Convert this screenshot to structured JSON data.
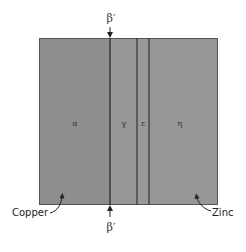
{
  "diagram": {
    "colors": {
      "alpha_fill": "#8e8e8e",
      "gamma_fill": "#969696",
      "epsilon_fill": "#989898",
      "eta_fill": "#969696",
      "line": "#333333",
      "border": "#555555"
    },
    "block": {
      "left": 39,
      "top": 38,
      "right": 218,
      "bottom": 205
    },
    "boundaries_x": [
      110,
      137,
      149
    ],
    "phases": [
      {
        "symbol": "α",
        "x": 75
      },
      {
        "symbol": "γ",
        "x": 124
      },
      {
        "symbol": "ε",
        "x": 143
      },
      {
        "symbol": "η",
        "x": 180
      }
    ],
    "top_marker": {
      "label": "β′",
      "x": 110
    },
    "bottom_marker": {
      "label": "β′",
      "x": 110
    },
    "left_label": "Copper",
    "right_label": "Zinc"
  }
}
